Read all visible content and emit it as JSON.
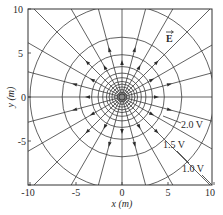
{
  "figure": {
    "type": "electric field lines and equipotentials of a point charge",
    "field_label": "E",
    "field_label_has_vector_arrow": true,
    "center": {
      "x": 0,
      "y": 0
    },
    "field_line_count": 24,
    "field_line_spacing_deg": 15,
    "field_direction": "outward",
    "equipotential_radii_m": [
      10.0,
      6.5,
      4.6,
      3.3,
      2.6,
      2.1,
      1.7,
      1.4,
      1.1,
      0.8,
      0.5
    ],
    "equipotential_labels": [
      {
        "text": "2.0 V",
        "radius_m": 4.6
      },
      {
        "text": "1.5 V",
        "radius_m": 6.5
      },
      {
        "text": "1.0 V",
        "radius_m": 10.0
      }
    ],
    "arrow_radii_m": [
      3.7,
      5.3
    ],
    "colors": {
      "lines": "#3a3a3a",
      "background": "#ffffff",
      "text": "#2a2a2a"
    }
  },
  "axes": {
    "xlabel": "x (m)",
    "ylabel": "y (m)",
    "xlim": [
      -10,
      10
    ],
    "ylim": [
      -10,
      10
    ],
    "xticks": [
      "-10",
      "-5",
      "0",
      "5",
      "10"
    ],
    "yticks": [
      "10",
      "5",
      "0",
      "-5"
    ]
  }
}
